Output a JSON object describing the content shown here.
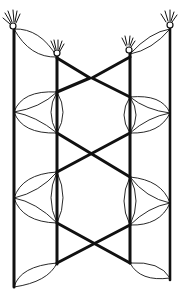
{
  "figure": {
    "title": "",
    "colors": {
      "ink": "#111111",
      "background": "#ffffff"
    },
    "components": {
      "poles": [
        "left-outer",
        "left-inner",
        "right-inner",
        "right-outer"
      ],
      "heads_with_tufts": 4,
      "x_crossings": 2,
      "lens_clusters": 4,
      "top_lens": 2,
      "bottom_lens": 2
    }
  }
}
